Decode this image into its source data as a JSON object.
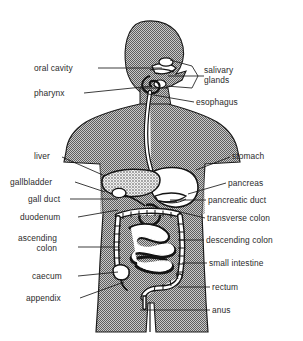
{
  "figure": {
    "type": "anatomical-diagram",
    "background_color": "#ffffff",
    "body_fill_color": "#8a8a8a",
    "organ_outline_color": "#1a1a1a",
    "organ_fill_color": "#ffffff",
    "label_text_color": "#2b2b2b",
    "leader_line_color": "#1a1a1a"
  },
  "labels_left": [
    {
      "id": "oral-cavity",
      "text": "oral cavity",
      "x": 34,
      "y": 64,
      "line": [
        [
          98,
          68
        ],
        [
          162,
          68
        ]
      ]
    },
    {
      "id": "pharynx",
      "text": "pharynx",
      "x": 34,
      "y": 89,
      "line": [
        [
          84,
          93
        ],
        [
          152,
          86
        ]
      ]
    },
    {
      "id": "liver",
      "text": "liver",
      "x": 34,
      "y": 152,
      "line": [
        [
          62,
          157
        ],
        [
          105,
          176
        ]
      ]
    },
    {
      "id": "gallbladder",
      "text": "gallbladder",
      "x": 10,
      "y": 178,
      "line": [
        [
          75,
          182
        ],
        [
          105,
          192
        ]
      ]
    },
    {
      "id": "gall-duct",
      "text": "gall duct",
      "x": 28,
      "y": 195,
      "line": [
        [
          70,
          199
        ],
        [
          118,
          199
        ]
      ]
    },
    {
      "id": "duodenum",
      "text": "duodenum",
      "x": 20,
      "y": 213,
      "line": [
        [
          78,
          217
        ],
        [
          118,
          210
        ]
      ]
    },
    {
      "id": "ascending-colon",
      "text": "ascending\ncolon",
      "x": 18,
      "y": 234,
      "line": [
        [
          78,
          247
        ],
        [
          118,
          247
        ]
      ]
    },
    {
      "id": "caecum",
      "text": "caecum",
      "x": 32,
      "y": 272,
      "line": [
        [
          78,
          276
        ],
        [
          118,
          272
        ]
      ]
    },
    {
      "id": "appendix",
      "text": "appendix",
      "x": 26,
      "y": 294,
      "line": [
        [
          80,
          298
        ],
        [
          124,
          282
        ]
      ]
    }
  ],
  "labels_right": [
    {
      "id": "salivary-glands",
      "text": "salivary\nglands",
      "x": 204,
      "y": 66,
      "line": [
        [
          198,
          76
        ],
        [
          168,
          76
        ]
      ]
    },
    {
      "id": "esophagus",
      "text": "esophagus",
      "x": 196,
      "y": 98,
      "line": [
        [
          194,
          102
        ],
        [
          148,
          94
        ]
      ]
    },
    {
      "id": "stomach",
      "text": "stomach",
      "x": 232,
      "y": 152,
      "line": [
        [
          230,
          157
        ],
        [
          196,
          170
        ]
      ]
    },
    {
      "id": "pancreas",
      "text": "pancreas",
      "x": 228,
      "y": 179,
      "line": [
        [
          226,
          183
        ],
        [
          188,
          194
        ]
      ]
    },
    {
      "id": "pancreatic-duct",
      "text": "pancreatic duct",
      "x": 208,
      "y": 196,
      "line": [
        [
          206,
          200
        ],
        [
          170,
          200
        ]
      ]
    },
    {
      "id": "transverse-colon",
      "text": "transverse colon",
      "x": 207,
      "y": 214,
      "line": [
        [
          205,
          218
        ],
        [
          172,
          210
        ]
      ]
    },
    {
      "id": "descending-colon",
      "text": "descending colon",
      "x": 206,
      "y": 236,
      "line": [
        [
          204,
          240
        ],
        [
          180,
          240
        ]
      ]
    },
    {
      "id": "small-intestine",
      "text": "small intestine",
      "x": 209,
      "y": 259,
      "line": [
        [
          207,
          263
        ],
        [
          182,
          263
        ]
      ]
    },
    {
      "id": "rectum",
      "text": "rectum",
      "x": 212,
      "y": 283,
      "line": [
        [
          210,
          287
        ],
        [
          178,
          287
        ]
      ]
    },
    {
      "id": "anus",
      "text": "anus",
      "x": 212,
      "y": 306,
      "line": [
        [
          210,
          310
        ],
        [
          140,
          310
        ]
      ]
    }
  ],
  "organs": [
    {
      "id": "oral-cavity",
      "name": "oral cavity"
    },
    {
      "id": "pharynx",
      "name": "pharynx"
    },
    {
      "id": "salivary-glands",
      "name": "salivary glands"
    },
    {
      "id": "esophagus",
      "name": "esophagus"
    },
    {
      "id": "stomach",
      "name": "stomach"
    },
    {
      "id": "liver",
      "name": "liver"
    },
    {
      "id": "gallbladder",
      "name": "gallbladder"
    },
    {
      "id": "gall-duct",
      "name": "gall duct"
    },
    {
      "id": "pancreas",
      "name": "pancreas"
    },
    {
      "id": "pancreatic-duct",
      "name": "pancreatic duct"
    },
    {
      "id": "duodenum",
      "name": "duodenum"
    },
    {
      "id": "transverse-colon",
      "name": "transverse colon"
    },
    {
      "id": "ascending-colon",
      "name": "ascending colon"
    },
    {
      "id": "descending-colon",
      "name": "descending colon"
    },
    {
      "id": "small-intestine",
      "name": "small intestine"
    },
    {
      "id": "caecum",
      "name": "caecum"
    },
    {
      "id": "appendix",
      "name": "appendix"
    },
    {
      "id": "rectum",
      "name": "rectum"
    },
    {
      "id": "anus",
      "name": "anus"
    }
  ]
}
